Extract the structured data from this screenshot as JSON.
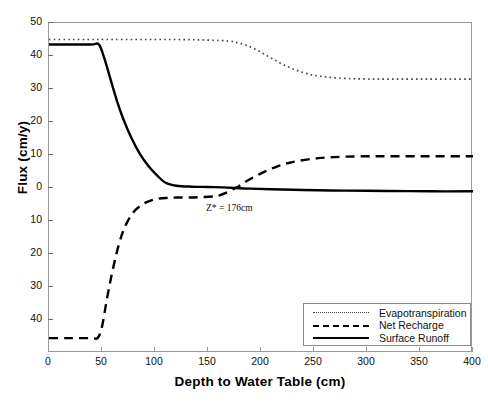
{
  "chart_data": {
    "type": "line",
    "title": "",
    "xlabel": "Depth to Water Table (cm)",
    "ylabel": "Flux (cm/y)",
    "xlim": [
      0,
      400
    ],
    "ylim": [
      -50,
      50
    ],
    "grid": false,
    "legend_position": "bottom-right",
    "xticks": [
      "0",
      "50",
      "100",
      "150",
      "200",
      "250",
      "300",
      "350",
      "400"
    ],
    "xtick_values": [
      0,
      50,
      100,
      150,
      200,
      250,
      300,
      350,
      400
    ],
    "yticks": [
      "50",
      "40",
      "30",
      "20",
      "10",
      "0",
      "10",
      "20",
      "30",
      "40"
    ],
    "ytick_values": [
      50,
      40,
      30,
      20,
      10,
      0,
      -10,
      -20,
      -30,
      -40
    ],
    "annotations": [
      {
        "text": "Z* = 176cm",
        "x": 176,
        "y": -5.5
      }
    ],
    "series": [
      {
        "name": "Evapotranspiration",
        "style": "dotted",
        "color": "#444444",
        "x": [
          0,
          20,
          40,
          47,
          60,
          80,
          100,
          120,
          140,
          160,
          170,
          176,
          185,
          195,
          205,
          215,
          225,
          235,
          245,
          255,
          270,
          290,
          310,
          330,
          350,
          370,
          390,
          400
        ],
        "y": [
          45.0,
          45.0,
          45.0,
          45.0,
          45.0,
          45.0,
          45.0,
          45.0,
          44.9,
          44.7,
          44.5,
          44.2,
          43.4,
          42.0,
          40.2,
          38.4,
          36.8,
          35.5,
          34.5,
          33.9,
          33.4,
          33.1,
          33.0,
          33.0,
          33.0,
          33.0,
          33.0,
          33.0
        ]
      },
      {
        "name": "Net Recharge",
        "style": "dashed",
        "color": "#000000",
        "x": [
          0,
          20,
          40,
          46,
          50,
          55,
          60,
          66,
          72,
          80,
          88,
          96,
          104,
          112,
          120,
          140,
          160,
          176,
          185,
          195,
          205,
          215,
          225,
          235,
          250,
          265,
          280,
          300,
          320,
          350,
          380,
          400
        ],
        "y": [
          -45.5,
          -45.5,
          -45.5,
          -45.4,
          -42.0,
          -33.0,
          -25.0,
          -17.0,
          -11.5,
          -7.2,
          -5.0,
          -3.8,
          -3.2,
          -3.0,
          -2.9,
          -2.8,
          -2.3,
          0.0,
          1.8,
          3.6,
          5.2,
          6.5,
          7.5,
          8.2,
          8.9,
          9.3,
          9.5,
          9.6,
          9.6,
          9.6,
          9.6,
          9.6
        ]
      },
      {
        "name": "Surface Runoff",
        "style": "solid",
        "color": "#000000",
        "x": [
          0,
          20,
          40,
          47,
          52,
          58,
          64,
          70,
          78,
          86,
          94,
          102,
          110,
          120,
          135,
          150,
          165,
          176,
          190,
          210,
          240,
          280,
          320,
          360,
          400
        ],
        "y": [
          43.5,
          43.5,
          43.5,
          43.5,
          39.5,
          33.0,
          26.5,
          21.0,
          15.0,
          10.2,
          6.6,
          3.8,
          1.6,
          0.7,
          0.4,
          0.3,
          0.2,
          0.0,
          -0.2,
          -0.4,
          -0.6,
          -0.8,
          -0.9,
          -1.0,
          -1.0
        ]
      }
    ]
  },
  "legend": {
    "items": [
      {
        "label": "Evapotranspiration"
      },
      {
        "label": "Net Recharge"
      },
      {
        "label": "Surface Runoff"
      }
    ]
  },
  "caption": {
    "text": ""
  }
}
